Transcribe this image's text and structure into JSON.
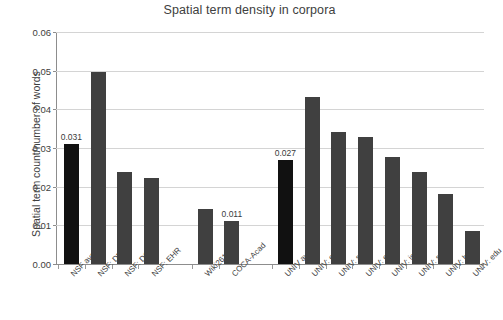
{
  "chart_data": {
    "type": "bar",
    "title": "Spatial term density in corpora",
    "xlabel": "",
    "ylabel": "Spatial term count/number of words",
    "ylim": [
      0,
      0.06
    ],
    "yticks": [
      "0.00",
      "0.01",
      "0.02",
      "0.03",
      "0.04",
      "0.05",
      "0.06"
    ],
    "ytick_values": [
      0,
      0.01,
      0.02,
      0.03,
      0.04,
      0.05,
      0.06
    ],
    "grid": true,
    "legend": "none",
    "categories": [
      "NSF avg",
      "NSF: DMS",
      "NSF: DGE",
      "NSF: EHR",
      "Wiki2615",
      "COCA-Acad",
      "UNIV avg",
      "UNIV: eng",
      "UNIV: sci",
      "UNIV: env",
      "UNIV: int",
      "UNIV: soc",
      "UNIV: hum",
      "UNIV: edu"
    ],
    "values": [
      0.031,
      0.0497,
      0.0237,
      0.0222,
      0.0141,
      0.011,
      0.027,
      0.0432,
      0.0342,
      0.0328,
      0.0278,
      0.0238,
      0.0182,
      0.0085
    ],
    "data_labels": [
      "0.031",
      "",
      "",
      "",
      "",
      "0.011",
      "0.027",
      "",
      "",
      "",
      "",
      "",
      "",
      ""
    ],
    "highlight_indices": [
      0,
      6
    ],
    "slots": [
      0,
      1,
      2,
      3,
      5,
      6,
      8,
      9,
      10,
      11,
      12,
      13,
      14,
      15
    ],
    "slot_count": 16,
    "colors": {
      "bar": "#404040",
      "bar_highlight": "#111111",
      "grid": "#d4d4d4",
      "axis": "#8d8d8d",
      "text": "#3d3d3d",
      "background": "#ffffff"
    }
  }
}
